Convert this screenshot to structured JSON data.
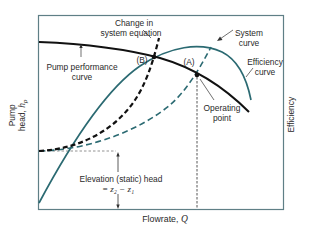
{
  "diagram": {
    "type": "pump-system-operating-point",
    "colors": {
      "frame": "#5f7f86",
      "pump_curve": "#111111",
      "efficiency_curve": "#2b6a72",
      "system_curve": "#2b6a72",
      "changed_system_curve": "#111111",
      "guides": "#555555",
      "text": "#2a2a2a"
    },
    "axes": {
      "x_label_text": "Flowrate, ",
      "x_label_var": "Q",
      "y_left_label_line1": "Pump",
      "y_left_label_line2_text": "head, ",
      "y_left_label_line2_var": "h",
      "y_left_label_line2_sub": "p",
      "y_right_label": "Efficiency"
    },
    "labels": {
      "change_in_system_line1": "Change in",
      "change_in_system_line2": "system equation",
      "pump_performance_line1": "Pump performance",
      "pump_performance_line2": "curve",
      "system_curve_line1": "System",
      "system_curve_line2": "curve",
      "efficiency_curve_line1": "Efficiency",
      "efficiency_curve_line2": "curve",
      "operating_point_line1": "Operating",
      "operating_point_line2": "point",
      "point_a": "(A)",
      "point_b": "(B)",
      "elevation_line1": "Elevation (static) head",
      "elevation_line2": "= z₂ − z₁"
    },
    "curves": [
      {
        "name": "Pump performance curve",
        "style": "solid",
        "color": "black"
      },
      {
        "name": "Efficiency curve",
        "style": "solid",
        "color": "teal"
      },
      {
        "name": "System curve",
        "style": "dashed",
        "color": "teal"
      },
      {
        "name": "Changed system curve",
        "style": "dashed",
        "color": "black"
      }
    ],
    "points": [
      {
        "name": "A",
        "description": "Operating point (pump curve ∩ system curve)"
      },
      {
        "name": "B",
        "description": "Operating point after change in system equation"
      }
    ]
  }
}
